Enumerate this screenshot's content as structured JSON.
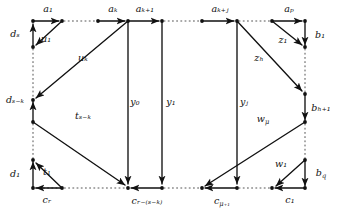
{
  "figure": {
    "type": "directed-graph-diagram",
    "background_color": "#ffffff",
    "stroke_color": "#111111",
    "dotted_color": "#555555",
    "caption": ""
  },
  "labels": {
    "a_1": "a₁",
    "a_k": "aₖ",
    "a_k1": "aₖ₊₁",
    "a_kj": "aₖ₊ⱼ",
    "a_p": "aₚ",
    "b_1": "b₁",
    "b_h1": "bₕ₊₁",
    "b_q": "b_q",
    "c_r": "cᵣ",
    "c_rsk": "cᵣ₋₍ₛ₋ₖ₎",
    "c_mu1": "c_μ₊₁",
    "c_1": "c₁",
    "d_s": "dₛ",
    "d_sk": "dₛ₋ₖ",
    "d_1": "d₁",
    "u_1": "u₁",
    "u_k": "uₖ",
    "t_1": "t₁",
    "t_sk": "tₛ₋ₖ",
    "y_0": "y₀",
    "y_1": "y₁",
    "y_j": "yⱼ",
    "z_1": "z₁",
    "z_h": "zₕ",
    "w_1": "w₁",
    "w_mu": "w_μ"
  },
  "nodes": [
    {
      "name": "node-top-1",
      "x": 33,
      "y": 21
    },
    {
      "name": "node-top-2",
      "x": 62,
      "y": 21
    },
    {
      "name": "node-top-3",
      "x": 98,
      "y": 21
    },
    {
      "name": "node-top-4",
      "x": 128,
      "y": 21
    },
    {
      "name": "node-top-5",
      "x": 162,
      "y": 21
    },
    {
      "name": "node-top-6",
      "x": 202,
      "y": 21
    },
    {
      "name": "node-top-7",
      "x": 237,
      "y": 21
    },
    {
      "name": "node-top-8",
      "x": 272,
      "y": 21
    },
    {
      "name": "node-top-9",
      "x": 305,
      "y": 21
    },
    {
      "name": "node-left-2",
      "x": 33,
      "y": 47
    },
    {
      "name": "node-left-3",
      "x": 33,
      "y": 100
    },
    {
      "name": "node-left-4",
      "x": 33,
      "y": 122
    },
    {
      "name": "node-left-5",
      "x": 33,
      "y": 160
    },
    {
      "name": "node-bot-1",
      "x": 33,
      "y": 188
    },
    {
      "name": "node-bot-2",
      "x": 62,
      "y": 188
    },
    {
      "name": "node-bot-3",
      "x": 128,
      "y": 188
    },
    {
      "name": "node-bot-4",
      "x": 162,
      "y": 188
    },
    {
      "name": "node-bot-5",
      "x": 202,
      "y": 188
    },
    {
      "name": "node-bot-6",
      "x": 237,
      "y": 188
    },
    {
      "name": "node-bot-7",
      "x": 272,
      "y": 188
    },
    {
      "name": "node-bot-8",
      "x": 305,
      "y": 188
    },
    {
      "name": "node-right-2",
      "x": 305,
      "y": 47
    },
    {
      "name": "node-right-3",
      "x": 305,
      "y": 94
    },
    {
      "name": "node-right-4",
      "x": 305,
      "y": 122
    },
    {
      "name": "node-right-5",
      "x": 305,
      "y": 160
    }
  ],
  "label_positions": {
    "a_1": {
      "x": 48,
      "y": 9
    },
    "a_k": {
      "x": 113,
      "y": 9
    },
    "a_k1": {
      "x": 145,
      "y": 9
    },
    "a_kj": {
      "x": 220,
      "y": 9
    },
    "a_p": {
      "x": 289,
      "y": 9
    },
    "b_1": {
      "x": 320,
      "y": 35
    },
    "b_h1": {
      "x": 321,
      "y": 108
    },
    "b_q": {
      "x": 321,
      "y": 173
    },
    "c_r": {
      "x": 47,
      "y": 200
    },
    "c_rsk": {
      "x": 147,
      "y": 201
    },
    "c_mu1": {
      "x": 222,
      "y": 201
    },
    "c_1": {
      "x": 290,
      "y": 200
    },
    "d_s": {
      "x": 15,
      "y": 34
    },
    "d_sk": {
      "x": 15,
      "y": 100
    },
    "d_1": {
      "x": 15,
      "y": 174
    },
    "u_1": {
      "x": 46,
      "y": 39
    },
    "u_k": {
      "x": 83,
      "y": 58
    },
    "t_1": {
      "x": 47,
      "y": 172
    },
    "t_sk": {
      "x": 83,
      "y": 116
    },
    "y_0": {
      "x": 135,
      "y": 102
    },
    "y_1": {
      "x": 171,
      "y": 102
    },
    "y_j": {
      "x": 244,
      "y": 102
    },
    "z_1": {
      "x": 283,
      "y": 40
    },
    "z_h": {
      "x": 259,
      "y": 58
    },
    "w_1": {
      "x": 281,
      "y": 164
    },
    "w_mu": {
      "x": 263,
      "y": 119
    }
  }
}
